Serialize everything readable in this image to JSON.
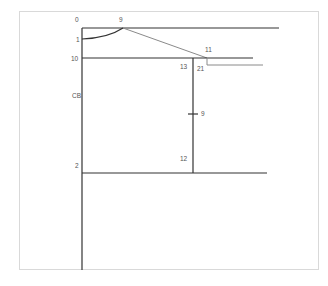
{
  "diagram": {
    "type": "pattern-draft",
    "colors": {
      "primary_line": "#333333",
      "secondary_line": "#8a8a8a",
      "label": "#555555",
      "frame": "#d9d9d9"
    },
    "labels": {
      "p0": "0",
      "p9_top": "9",
      "p1": "1",
      "p10": "10",
      "cb": "CB",
      "p2": "2",
      "p11": "11",
      "p13": "13",
      "p21": "21",
      "p9_mid": "9",
      "p12": "12"
    }
  }
}
